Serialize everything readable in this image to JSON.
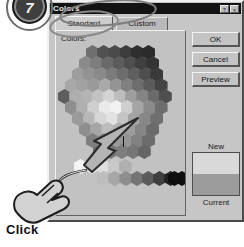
{
  "annotation": {
    "step_badge": "7",
    "action_label": "Click",
    "cursor_icon": "hand-pointer-icon",
    "arrow_icon": "arrow-pointer-icon"
  },
  "dialog": {
    "title": "Colors",
    "title_buttons": [
      {
        "name": "help-button",
        "glyph": "?"
      },
      {
        "name": "close-button",
        "glyph": "×"
      }
    ],
    "tabs": [
      {
        "label": "Standard",
        "active": true
      },
      {
        "label": "Custom",
        "active": false
      }
    ],
    "colors_label": "Colors:",
    "buttons": [
      {
        "id": "ok",
        "label": "OK"
      },
      {
        "id": "cancel",
        "label": "Cancel"
      },
      {
        "id": "preview",
        "label": "Preview"
      }
    ],
    "preview": {
      "new_label": "New",
      "current_label": "Current",
      "new_color": "#d9d9d9",
      "current_color": "#9c9c9c"
    },
    "palette": {
      "type": "hexagonal-honeycomb",
      "selected_index": 61,
      "selected_color": "#9a9a9a",
      "rows": [
        {
          "y": 2,
          "x": 30,
          "colors": [
            "#6f6f6f",
            "#515151",
            "#4a4a4a",
            "#3c3c3c",
            "#2f2f2f",
            "#2b2b2b"
          ]
        },
        {
          "y": 13,
          "x": 23,
          "colors": [
            "#8a8a8a",
            "#7d7d7d",
            "#6a6a6a",
            "#5c5c5c",
            "#4e4e4e",
            "#3f3f3f",
            "#343434"
          ]
        },
        {
          "y": 24,
          "x": 16,
          "colors": [
            "#9d9d9d",
            "#939393",
            "#8a8a8a",
            "#7b7b7b",
            "#6d6d6d",
            "#5f5f5f",
            "#4e4e4e",
            "#3a3a3a"
          ]
        },
        {
          "y": 35,
          "x": 9,
          "colors": [
            "#a8a8a8",
            "#a2a2a2",
            "#9b9b9b",
            "#a9a9a9",
            "#949494",
            "#818181",
            "#6e6e6e",
            "#5b5b5b",
            "#444444"
          ]
        },
        {
          "y": 46,
          "x": 2,
          "colors": [
            "#5e5e5e",
            "#aeaeae",
            "#b4b4b4",
            "#c2c2c2",
            "#d4d4d4",
            "#bdbdbd",
            "#9e9e9e",
            "#848484",
            "#6a6a6a",
            "#4f4f4f"
          ]
        },
        {
          "y": 57,
          "x": 9,
          "colors": [
            "#8f8f8f",
            "#b0b0b0",
            "#cfcfcf",
            "#eaeaea",
            "#f2f2f2",
            "#cfcfcf",
            "#a5a5a5",
            "#8a8a8a",
            "#6d6d6d"
          ]
        },
        {
          "y": 68,
          "x": 16,
          "colors": [
            "#9a9a9a",
            "#b8b8b8",
            "#d6d6d6",
            "#e2e2e2",
            "#c4c4c4",
            "#a3a3a3",
            "#878787",
            "#6f6f6f"
          ]
        },
        {
          "y": 79,
          "x": 23,
          "colors": [
            "#8e8e8e",
            "#a6a6a6",
            "#bcbcbc",
            "#b2b2b2",
            "#9c9c9c",
            "#858585",
            "#6b6b6b"
          ]
        },
        {
          "y": 90,
          "x": 30,
          "colors": [
            "#7e7e7e",
            "#8e8e8e",
            "#9a9a9a",
            "#949494",
            "#828282",
            "#6c6c6c"
          ]
        },
        {
          "y": 101,
          "x": 37,
          "colors": [
            "#6b6b6b",
            "#767676",
            "#7e7e7e",
            "#767676",
            "#666666"
          ]
        },
        {
          "y": 116,
          "x": 18,
          "colors": [
            "#f4f4f4",
            "#ececec",
            "#dedede",
            "#c9c9c9",
            "#b0b0b0"
          ]
        },
        {
          "y": 128,
          "x": 41,
          "colors": [
            "#bdbdbd",
            "#a6a6a6",
            "#8e8e8e",
            "#747474",
            "#5c5c5c",
            "#3f3f3f",
            "#222222",
            "#101010"
          ]
        },
        {
          "y": 128,
          "x": 112,
          "colors": [
            "#0d0d0d"
          ]
        }
      ]
    }
  }
}
